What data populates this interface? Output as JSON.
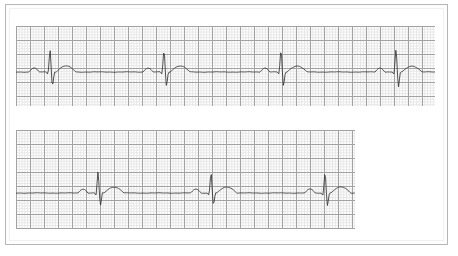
{
  "document": {
    "title": "ECG Rhythm Strip",
    "background_color": "#ffffff",
    "frame_color": "#b6b6b6",
    "width": 458,
    "height": 256
  },
  "grid": {
    "minor_color": "#e6e6e6",
    "major_color": "#a2a2a2",
    "minor_size_px": 2.8,
    "major_size_px": 14,
    "minor_per_major": 5
  },
  "trace": {
    "color": "#333333",
    "width_px": 0.8
  },
  "chart_data": {
    "type": "line",
    "xlabel": "Time",
    "ylabel": "Amplitude",
    "grid": true,
    "legend": "none",
    "paper_speed": "25 mm/s",
    "gain": "10 mm/mV",
    "series": [
      {
        "name": "strip-1",
        "panel": "top",
        "baseline_y": 46,
        "beat_interval_px": 115,
        "beat_positions_px": [
          34,
          148,
          265,
          380
        ],
        "beat_count": 4,
        "morphology": {
          "p_wave": {
            "offset_px": -16,
            "amplitude_px": -4,
            "width_px": 10
          },
          "q_wave": {
            "offset_px": -2,
            "amplitude_px": 2
          },
          "r_wave": {
            "offset_px": 0,
            "amplitude_px": -24
          },
          "s_wave": {
            "offset_px": 2.5,
            "amplitude_px": 15
          },
          "t_wave": {
            "offset_px": 16,
            "amplitude_px": -6,
            "width_px": 20
          }
        }
      },
      {
        "name": "strip-2",
        "panel": "bottom",
        "baseline_y": 63,
        "beat_interval_px": 113,
        "beat_positions_px": [
          82,
          195,
          309
        ],
        "beat_count": 3,
        "morphology": {
          "p_wave": {
            "offset_px": -15,
            "amplitude_px": -4,
            "width_px": 10
          },
          "q_wave": {
            "offset_px": -2,
            "amplitude_px": 2
          },
          "r_wave": {
            "offset_px": 0,
            "amplitude_px": -22
          },
          "s_wave": {
            "offset_px": 2.5,
            "amplitude_px": 13
          },
          "t_wave": {
            "offset_px": 16,
            "amplitude_px": -6,
            "width_px": 20
          }
        }
      }
    ]
  },
  "panels": [
    {
      "name": "ecg-strip-top",
      "x": 16,
      "y": 26,
      "width": 419,
      "height": 80
    },
    {
      "name": "ecg-strip-bottom",
      "x": 16,
      "y": 130,
      "width": 339,
      "height": 99
    }
  ]
}
